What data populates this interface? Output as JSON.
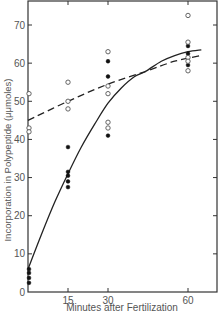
{
  "chart_data": {
    "type": "scatter",
    "title": "",
    "xlabel": "Minutes after Fertilization",
    "ylabel": "Incorporation in Polypeptide (μμmoles)",
    "xlim": [
      0,
      65
    ],
    "ylim": [
      0,
      76
    ],
    "xticks": [
      15,
      30,
      60
    ],
    "yticks": [
      0,
      10,
      20,
      30,
      40,
      50,
      60,
      70
    ],
    "grid": false,
    "legend": null,
    "series": [
      {
        "name": "filled circles",
        "marker": "filled-circle",
        "points": [
          [
            0,
            6
          ],
          [
            0,
            5
          ],
          [
            0,
            3.7
          ],
          [
            0,
            2.4
          ],
          [
            15,
            38
          ],
          [
            15,
            31.5
          ],
          [
            15,
            30.5
          ],
          [
            15,
            29
          ],
          [
            15,
            27.5
          ],
          [
            30,
            60.5
          ],
          [
            30,
            56.5
          ],
          [
            30,
            41
          ],
          [
            60,
            64.5
          ],
          [
            60,
            62.5
          ],
          [
            60,
            59.5
          ]
        ]
      },
      {
        "name": "open circles",
        "marker": "open-circle",
        "points": [
          [
            0,
            52
          ],
          [
            0,
            43
          ],
          [
            0,
            42
          ],
          [
            15,
            55
          ],
          [
            15,
            50
          ],
          [
            15,
            48
          ],
          [
            30,
            63
          ],
          [
            30,
            54
          ],
          [
            30,
            52
          ],
          [
            30,
            44.5
          ],
          [
            30,
            43
          ],
          [
            60,
            72.5
          ],
          [
            60,
            65.5
          ],
          [
            60,
            61.5
          ],
          [
            60,
            60.5
          ],
          [
            60,
            58
          ]
        ]
      },
      {
        "name": "solid curve (fit to filled circles)",
        "style": "solid",
        "points": [
          [
            0,
            6
          ],
          [
            5,
            15
          ],
          [
            10,
            23.5
          ],
          [
            15,
            31
          ],
          [
            20,
            38
          ],
          [
            25,
            44
          ],
          [
            30,
            49.5
          ],
          [
            35,
            53.5
          ],
          [
            40,
            56.5
          ],
          [
            44,
            57.8
          ],
          [
            50,
            60.5
          ],
          [
            55,
            62
          ],
          [
            60,
            63
          ],
          [
            65,
            63.5
          ]
        ]
      },
      {
        "name": "dashed curve (fit to open circles)",
        "style": "dashed",
        "points": [
          [
            0,
            45
          ],
          [
            15,
            50
          ],
          [
            30,
            54.5
          ],
          [
            44,
            57.8
          ],
          [
            55,
            60.5
          ],
          [
            65,
            62
          ]
        ]
      }
    ]
  },
  "axes": {
    "xlabel": "Minutes after Fertilization",
    "ylabel": "Incorporation in Polypeptide (μμmoles)",
    "xtick_labels": [
      "15",
      "30",
      "60"
    ],
    "ytick_labels": [
      "0",
      "10",
      "20",
      "30",
      "40",
      "50",
      "60",
      "70"
    ]
  }
}
